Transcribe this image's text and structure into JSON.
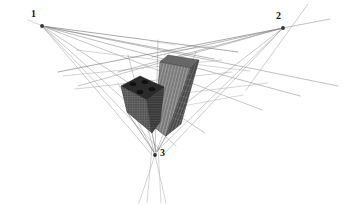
{
  "figure": {
    "kind": "three-point-perspective-construction",
    "width": 344,
    "height": 205,
    "background_color": "#ffffff"
  },
  "vanishing_points": [
    {
      "id": "1",
      "label": "1",
      "x": 42,
      "y": 26,
      "label_x": 31,
      "label_y": 9,
      "dot_color": "#333333"
    },
    {
      "id": "2",
      "label": "2",
      "x": 283,
      "y": 28,
      "label_x": 276,
      "label_y": 11,
      "dot_color": "#333333"
    },
    {
      "id": "3",
      "label": "3",
      "x": 155,
      "y": 155,
      "label_x": 160,
      "label_y": 148,
      "dot_color": "#333333"
    }
  ],
  "colors": {
    "line_dark": "#4a4a4a",
    "line_mid": "#808080",
    "line_light": "#b4b4b4",
    "tower_top_face": "#5a5a5a",
    "tower_left_face": "#7a7a7a",
    "tower_right_face": "#4a4a4a",
    "block_top_face": "#2e2e2e",
    "block_left_face": "#555555",
    "block_right_face": "#3a3a3a",
    "rooftop_unit": "#141414",
    "label_text": "#1a1a1a"
  },
  "construction_lines": [
    {
      "name": "vp1-ray-a",
      "x1": 42,
      "y1": 26,
      "x2": 300,
      "y2": 97,
      "color": "#909090",
      "width": 0.6
    },
    {
      "name": "vp1-ray-b",
      "x1": 42,
      "y1": 26,
      "x2": 256,
      "y2": 110,
      "color": "#9a9a9a",
      "width": 0.6
    },
    {
      "name": "vp1-ray-c",
      "x1": 42,
      "y1": 26,
      "x2": 200,
      "y2": 131,
      "color": "#8a8a8a",
      "width": 0.6
    },
    {
      "name": "vp1-ray-d",
      "x1": 42,
      "y1": 26,
      "x2": 233,
      "y2": 54,
      "color": "#6a6a6a",
      "width": 0.6
    },
    {
      "name": "vp1-ray-e",
      "x1": 42,
      "y1": 26,
      "x2": 196,
      "y2": 59,
      "color": "#7a7a7a",
      "width": 0.6
    },
    {
      "name": "vp1-ray-f",
      "x1": 42,
      "y1": 26,
      "x2": 170,
      "y2": 122,
      "color": "#9a9a9a",
      "width": 0.6
    },
    {
      "name": "vp1-ray-g",
      "x1": 42,
      "y1": 26,
      "x2": 160,
      "y2": 142,
      "color": "#a4a4a4",
      "width": 0.6
    },
    {
      "name": "vp2-ray-a",
      "x1": 283,
      "y1": 28,
      "x2": 60,
      "y2": 76,
      "color": "#8a8a8a",
      "width": 0.6
    },
    {
      "name": "vp2-ray-b",
      "x1": 283,
      "y1": 28,
      "x2": 80,
      "y2": 88,
      "color": "#9a9a9a",
      "width": 0.6
    },
    {
      "name": "vp2-ray-c",
      "x1": 283,
      "y1": 28,
      "x2": 152,
      "y2": 56,
      "color": "#6e6e6e",
      "width": 0.6
    },
    {
      "name": "vp2-ray-d",
      "x1": 283,
      "y1": 28,
      "x2": 143,
      "y2": 132,
      "color": "#9a9a9a",
      "width": 0.6
    },
    {
      "name": "vp2-ray-e",
      "x1": 283,
      "y1": 28,
      "x2": 155,
      "y2": 150,
      "color": "#a0a0a0",
      "width": 0.6
    },
    {
      "name": "vp2-ray-f",
      "x1": 283,
      "y1": 28,
      "x2": 310,
      "y2": 22,
      "color": "#8a8a8a",
      "width": 0.6
    },
    {
      "name": "vp2-ray-g",
      "x1": 300,
      "y1": 5,
      "x2": 262,
      "y2": 62,
      "color": "#a0a0a0",
      "width": 0.6
    },
    {
      "name": "vp3-ray-a",
      "x1": 155,
      "y1": 155,
      "x2": 128,
      "y2": 56,
      "color": "#9a9a9a",
      "width": 0.6
    },
    {
      "name": "vp3-ray-b",
      "x1": 155,
      "y1": 155,
      "x2": 163,
      "y2": 41,
      "color": "#9a9a9a",
      "width": 0.6
    },
    {
      "name": "vp3-ray-c",
      "x1": 155,
      "y1": 155,
      "x2": 196,
      "y2": 54,
      "color": "#a0a0a0",
      "width": 0.6
    },
    {
      "name": "vp3-ray-d",
      "x1": 155,
      "y1": 155,
      "x2": 142,
      "y2": 202,
      "color": "#a8a8a8",
      "width": 0.6
    },
    {
      "name": "vp3-ray-e",
      "x1": 155,
      "y1": 155,
      "x2": 163,
      "y2": 202,
      "color": "#a8a8a8",
      "width": 0.6
    },
    {
      "name": "vp3-ray-f",
      "x1": 153,
      "y1": 146,
      "x2": 148,
      "y2": 202,
      "color": "#b0b0b0",
      "width": 0.6
    }
  ],
  "building": {
    "name": "L-shaped skyscraper",
    "parts": [
      {
        "name": "tall-tower",
        "description": "tall slab tower rising to the top-center"
      },
      {
        "name": "low-block",
        "description": "shorter wing block to the left with rooftop units"
      }
    ],
    "rooftop_units": 5,
    "facade_floor_lines": 16
  }
}
